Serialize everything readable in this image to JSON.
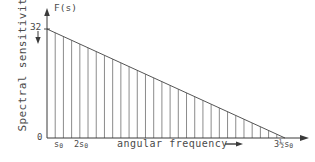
{
  "chart_data": {
    "type": "area",
    "title": "",
    "subtitle": "",
    "xlabel": "angular frequency",
    "ylabel": "Spectral sensitivity",
    "y_axis_symbol": "F(s)",
    "grid": false,
    "legend": null,
    "hatching": {
      "style": "vertical-lines",
      "count": 28,
      "color": "#6d6d6d"
    },
    "x_tick_labels": [
      "0",
      "s₀",
      "2s₀",
      "3½s₀"
    ],
    "x_tick_values": [
      0,
      1,
      2,
      3.5
    ],
    "y_tick_labels": [
      "0",
      "32"
    ],
    "y_tick_values": [
      0,
      32
    ],
    "xlim": [
      0,
      3.5
    ],
    "ylim": [
      0,
      32
    ],
    "series": [
      {
        "name": "F(s)",
        "x": [
          0,
          3.5
        ],
        "values": [
          32,
          0
        ],
        "shape": "linear-decreasing"
      }
    ],
    "annotations": [
      {
        "name": "y-axis-arrow",
        "glyph": "↑",
        "at": "y-axis-top"
      },
      {
        "name": "y-value-arrow",
        "glyph": "↓",
        "at": "32"
      },
      {
        "name": "x-axis-arrow",
        "glyph": "→",
        "at": "x-axis-right"
      },
      {
        "name": "xlabel-arrow",
        "glyph": "→",
        "at": "after-angular-frequency"
      }
    ]
  },
  "axes": {
    "y_symbol": "F(s)",
    "y_title": "Spectral sensitivity",
    "y_max_label": "32",
    "origin_label": "0",
    "x_title": "angular frequency",
    "x_tick_1": "s",
    "x_tick_1_sub": "0",
    "x_tick_2": "2s",
    "x_tick_2_sub": "0",
    "x_tick_end": "3½s",
    "x_tick_end_sub": "0"
  },
  "colors": {
    "background": "#ffffff",
    "ink": "#4a4a4a",
    "hatch": "#6d6d6d",
    "axis": "#3a3a3a"
  }
}
